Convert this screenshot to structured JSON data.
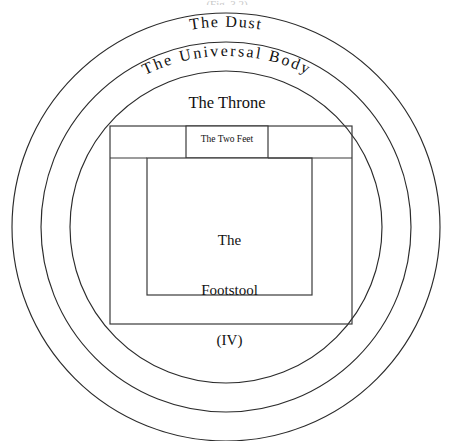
{
  "figure": {
    "type": "concentric-cosmology-diagram",
    "background_color": "#ffffff",
    "stroke_color": "#2b2b2b",
    "width": 454,
    "height": 441,
    "cropped_top_text": "(Fig. 3.2)"
  },
  "rings": [
    {
      "id": "ring-outer",
      "label": "The Dust",
      "label_style": "curved",
      "radius": 214,
      "center_x": 226,
      "center_y": 227
    },
    {
      "id": "ring-middle",
      "label": "The Universal Body",
      "label_style": "curved",
      "radius": 185,
      "center_x": 226,
      "center_y": 227
    },
    {
      "id": "ring-inner",
      "label": "The Throne",
      "label_style": "flat",
      "radius": 156,
      "center_x": 226,
      "center_y": 227
    }
  ],
  "boxes": [
    {
      "id": "box-throne-frame",
      "label": "",
      "x": 110,
      "y": 126,
      "width": 242,
      "height": 198
    },
    {
      "id": "box-two-feet",
      "label": "The Two Feet",
      "x": 186,
      "y": 126,
      "width": 82,
      "height": 32
    },
    {
      "id": "box-footstool",
      "label": "The Footstool (IV)",
      "label_lines": [
        "The",
        "Footstool",
        "(IV)"
      ],
      "x": 147,
      "y": 158,
      "width": 165,
      "height": 137
    }
  ],
  "labels": {
    "dust": "The Dust",
    "universal_body": "The Universal Body",
    "throne": "The Throne",
    "two_feet": "The Two Feet",
    "footstool_line1": "The",
    "footstool_line2": "Footstool",
    "footstool_line3": "(IV)"
  }
}
